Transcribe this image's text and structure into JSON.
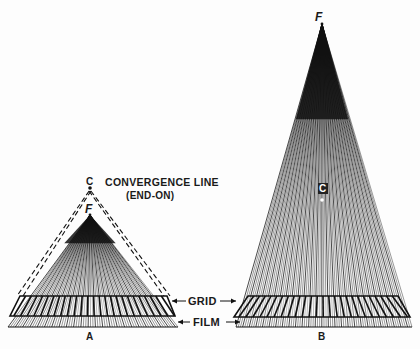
{
  "diagram": {
    "colors": {
      "ink": "#111111",
      "paper": "#fdfdfd"
    },
    "panel_a": {
      "caption": "A",
      "focal_label": "F",
      "convergence_point_label": "C",
      "convergence_line_label": "CONVERGENCE LINE",
      "convergence_line_sublabel": "(END-ON)",
      "focus": [
        90,
        215
      ],
      "convergence_point": [
        90,
        188
      ],
      "grid_top": 296,
      "grid_bottom": 316,
      "grid_top_x": [
        20,
        167
      ],
      "grid_bottom_x": [
        10,
        175
      ],
      "film_y": 327,
      "film_x": [
        8,
        178
      ],
      "ray_count": 70
    },
    "panel_b": {
      "caption": "B",
      "focal_label": "F",
      "convergence_point_label": "C",
      "focus": [
        322,
        24
      ],
      "convergence_point": [
        322,
        200
      ],
      "grid_top": 296,
      "grid_bottom": 317,
      "grid_top_x": [
        248,
        398
      ],
      "grid_bottom_x": [
        234,
        410
      ],
      "film_y": 327,
      "film_x": [
        236,
        412
      ],
      "ray_count": 80
    },
    "annotations": {
      "grid_label": "GRID",
      "film_label": "FILM"
    }
  }
}
